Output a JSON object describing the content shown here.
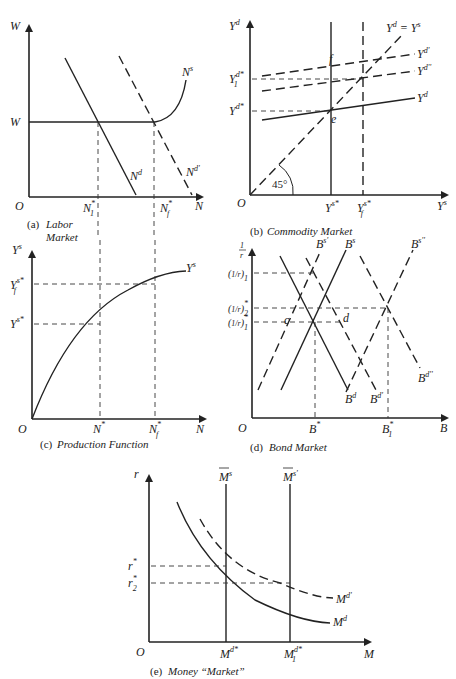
{
  "panels": {
    "labor": {
      "caption_prefix": "(a)",
      "caption": "Labor Market",
      "y_axis": "W",
      "x_axis": "N",
      "origin": "O",
      "w_level": "W",
      "ticks_x": [
        "N*1",
        "N*f"
      ],
      "curves": [
        "Ns",
        "Nd",
        "Nd'"
      ]
    },
    "commodity": {
      "caption_prefix": "(b)",
      "caption": "Commodity Market",
      "y_axis": "Yd",
      "x_axis": "Ys",
      "origin": "O",
      "angle": "45°",
      "ticks_y": [
        "Yd*1",
        "Yd*"
      ],
      "ticks_x": [
        "Ys*",
        "Ys*f"
      ],
      "curves": [
        "Yd = Ys",
        "Yd'",
        "Yd''",
        "Yd"
      ],
      "points": [
        "e",
        "f"
      ]
    },
    "production": {
      "caption_prefix": "(c)",
      "caption": "Production Function",
      "y_axis": "Ys",
      "x_axis": "N",
      "origin": "O",
      "ticks_y": [
        "Ys*f",
        "Ys*"
      ],
      "ticks_x": [
        "N*",
        "N*f"
      ],
      "curves": [
        "Ys"
      ]
    },
    "bond": {
      "caption_prefix": "(d)",
      "caption": "Bond Market",
      "y_axis": "1/r",
      "x_axis": "B",
      "origin": "O",
      "ticks_y": [
        "(1/r)1",
        "(1/r)*2",
        "(1/r)*1"
      ],
      "ticks_x": [
        "B*",
        "B*1"
      ],
      "curves": [
        "Bs'",
        "Bs",
        "Bs''",
        "Bd",
        "Bd'",
        "Bd''"
      ],
      "points": [
        "c",
        "d"
      ]
    },
    "money": {
      "caption_prefix": "(e)",
      "caption": "Money “Market”",
      "y_axis": "r",
      "x_axis": "M",
      "origin": "O",
      "ticks_y": [
        "r*",
        "r*2"
      ],
      "ticks_x": [
        "Md*",
        "Md*1"
      ],
      "curves": [
        "M̅s",
        "M̅s'",
        "Md'",
        "Md"
      ]
    }
  },
  "text": {
    "a_prefix": "(a)",
    "a_cap1": "Labor",
    "a_cap2": "Market",
    "b_prefix": "(b)",
    "b_cap": "Commodity Market",
    "c_prefix": "(c)",
    "c_cap": "Production Function",
    "d_prefix": "(d)",
    "d_cap": "Bond Market",
    "e_prefix": "(e)",
    "e_cap": "Money “Market”"
  }
}
